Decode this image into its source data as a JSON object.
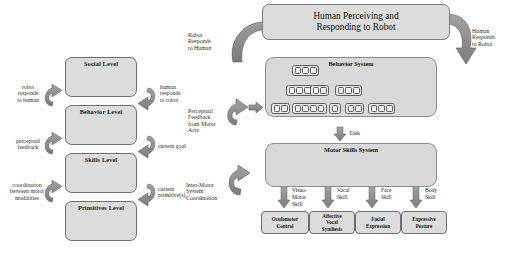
{
  "figure": {
    "colors": {
      "box_fill": "#dcdcdc",
      "box_stroke": "#6e6e6e",
      "arrow_fill": "#8c8c8c",
      "arrow_stroke": "#5a5a5a",
      "panel_fill": "#d9d9d9",
      "page_bg": "#ffffff",
      "text": "#1a1a1a"
    }
  },
  "left_panel": {
    "name": "level-hierarchy-diagram",
    "levels": [
      {
        "label": "Social Level"
      },
      {
        "label": "Behavior Level"
      },
      {
        "label": "Skills Level"
      },
      {
        "label": "Primitives Level"
      }
    ],
    "left_labels": [
      {
        "lines": [
          "robot",
          "responds",
          "to human"
        ]
      },
      {
        "lines": [
          "perceptual",
          "feedback"
        ]
      },
      {
        "lines": [
          "coordination",
          "between motor",
          "modalities"
        ]
      }
    ],
    "right_labels": [
      {
        "lines": [
          "human",
          "responds",
          "to robot"
        ]
      },
      {
        "lines": [
          "current goal"
        ]
      },
      {
        "lines": [
          "current",
          "primitive(s)"
        ]
      }
    ]
  },
  "right_panel": {
    "name": "system-architecture-diagram",
    "header": {
      "lines": [
        "Human Perceiving and",
        "Responding to Robot"
      ]
    },
    "side_labels": {
      "left_top": {
        "lines": [
          "Robot",
          "Responds",
          "to Human"
        ]
      },
      "left_mid": {
        "lines": [
          "Perceptual",
          "Feedback",
          "from Motor",
          "Acts"
        ]
      },
      "left_bottom": {
        "lines": [
          "Inter-Motor",
          "System",
          "Coordination"
        ]
      },
      "right_top": {
        "lines": [
          "Human",
          "Responds",
          "to Robot"
        ]
      }
    },
    "behavior_system": {
      "title": "Behavior System",
      "rows": [
        {
          "groups": [
            3
          ]
        },
        {
          "groups": [
            3,
            2,
            3
          ]
        },
        {
          "groups": [
            2,
            4,
            1,
            2,
            3
          ]
        }
      ]
    },
    "task_arrow_label": "Task",
    "motor_skills_system": {
      "title": "Motor Skills System",
      "network_count": 4
    },
    "skill_labels": [
      {
        "lines": [
          "Visuo-",
          "Motor",
          "Skill"
        ]
      },
      {
        "lines": [
          "Vocal",
          "Skill"
        ]
      },
      {
        "lines": [
          "Face",
          "Skill"
        ]
      },
      {
        "lines": [
          "Body",
          "Skill"
        ]
      }
    ],
    "outputs": [
      {
        "lines": [
          "Oculomotor",
          "Control"
        ]
      },
      {
        "lines": [
          "Affective",
          "Vocal",
          "Synthesis"
        ]
      },
      {
        "lines": [
          "Facial",
          "Expression"
        ]
      },
      {
        "lines": [
          "Expressive",
          "Posture"
        ]
      }
    ]
  }
}
